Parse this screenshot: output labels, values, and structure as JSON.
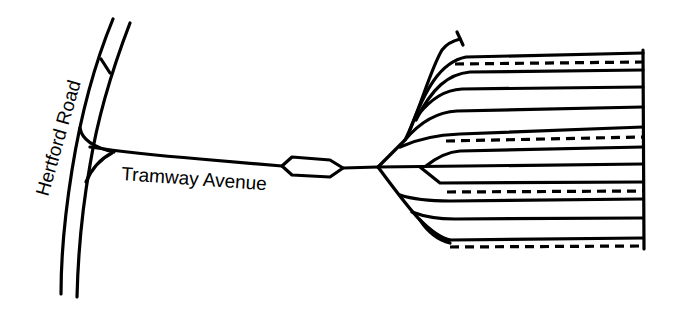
{
  "diagram": {
    "type": "tram-depot-track-layout",
    "labels": {
      "road": "Hertford Road",
      "avenue": "Tramway Avenue"
    },
    "colors": {
      "track": "#000000",
      "background": "#ffffff"
    },
    "depot": {
      "road_count": 14,
      "solid_tracks": 10,
      "dashed_tracks": 4,
      "stub_with_buffer": 1
    }
  }
}
